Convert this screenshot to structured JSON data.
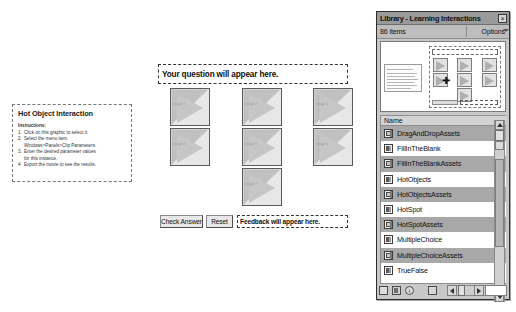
{
  "instruction_panel": {
    "title": "Hot Object Interaction",
    "subtitle": "Instructions:",
    "steps": [
      {
        "num": "1.",
        "text": "Click on this graphic to select it."
      },
      {
        "num": "2.",
        "text": "Select the menu item"
      },
      {
        "num": "2b",
        "text": "Windows>Panels>Clip Parameters."
      },
      {
        "num": "3.",
        "text": "Enter the desired parameter values"
      },
      {
        "num": "3b",
        "text": "for this instance."
      },
      {
        "num": "4.",
        "text": "Export the movie to see the results."
      }
    ]
  },
  "stage": {
    "question_placeholder": "Your question will appear here.",
    "feedback_placeholder": "Feedback will appear here.",
    "check_answer_label": "Check Answer",
    "reset_label": "Reset",
    "hot_objects": [
      {
        "label": "image 1"
      },
      {
        "label": "image 2"
      },
      {
        "label": "image 3"
      },
      {
        "label": "image 4"
      },
      {
        "label": "image 5"
      },
      {
        "label": "image 6"
      },
      {
        "label": "image 7"
      }
    ]
  },
  "library": {
    "title": "Library - Learning Interactions",
    "close_label": "×",
    "item_count": "86 items",
    "options_label": "Options",
    "column_header_name": "Name",
    "items": [
      {
        "label": "DragAndDropAssets",
        "icon": "folder-icon",
        "selected": true
      },
      {
        "label": "FillInTheBlank",
        "icon": "symbol-icon",
        "selected": false
      },
      {
        "label": "FillInTheBlankAssets",
        "icon": "folder-icon",
        "selected": true
      },
      {
        "label": "HotObjects",
        "icon": "symbol-icon",
        "selected": false
      },
      {
        "label": "HotObjectsAssets",
        "icon": "folder-icon",
        "selected": true
      },
      {
        "label": "HotSpot",
        "icon": "symbol-icon",
        "selected": false
      },
      {
        "label": "HotSpotAssets",
        "icon": "folder-icon",
        "selected": true
      },
      {
        "label": "MultipleChoice",
        "icon": "symbol-icon",
        "selected": false
      },
      {
        "label": "MultipleChoiceAssets",
        "icon": "folder-icon",
        "selected": true
      },
      {
        "label": "TrueFalse",
        "icon": "symbol-icon",
        "selected": false
      }
    ],
    "toolbar": {
      "new_symbol": "new-symbol-icon",
      "new_folder": "new-folder-icon",
      "properties": "i",
      "delete": "trash-icon"
    }
  }
}
